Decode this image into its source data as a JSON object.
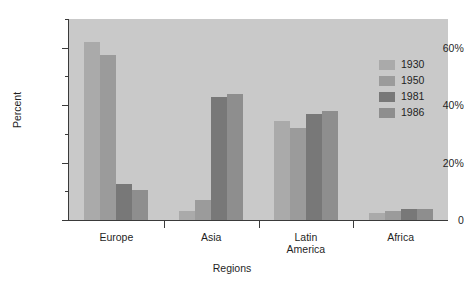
{
  "chart_data": {
    "type": "bar",
    "title": "",
    "xlabel": "Regions",
    "ylabel": "Percent",
    "ylim": [
      0,
      70
    ],
    "grid": false,
    "legend_position": "top-right-inside",
    "categories": [
      "Europe",
      "Asia",
      "Latin America",
      "Africa"
    ],
    "ytick_labels": [
      "0",
      "20%",
      "40%",
      "60%"
    ],
    "ytick_values": [
      0,
      20,
      40,
      60
    ],
    "yminor_values": [
      10,
      30,
      50,
      70
    ],
    "series": [
      {
        "name": "1930",
        "color": "#aaaaaa",
        "values": [
          62.0,
          3.0,
          34.5,
          2.5
        ]
      },
      {
        "name": "1950",
        "color": "#9b9b9b",
        "values": [
          57.5,
          7.0,
          32.0,
          3.0
        ]
      },
      {
        "name": "1981",
        "color": "#787878",
        "values": [
          12.5,
          43.0,
          37.0,
          4.0
        ]
      },
      {
        "name": "1986",
        "color": "#8e8e8e",
        "values": [
          10.5,
          44.0,
          38.0,
          4.0
        ]
      }
    ]
  },
  "style": {
    "plot_background": "#c9c9c9",
    "page_background": "#ffffff",
    "axis_color": "#3a3a3a",
    "text_color": "#1f1f1f"
  },
  "axis": {
    "x_title": "Regions",
    "y_title": "Percent"
  },
  "legend": {
    "entries": [
      {
        "label": "1930"
      },
      {
        "label": "1950"
      },
      {
        "label": "1981"
      },
      {
        "label": "1986"
      }
    ]
  }
}
